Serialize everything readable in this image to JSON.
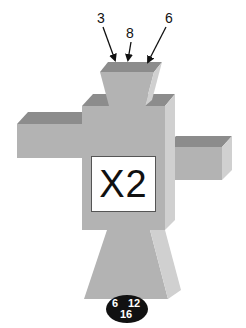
{
  "diagram": {
    "type": "block-figure",
    "center_label": "X2",
    "top_labels": [
      {
        "text": "3"
      },
      {
        "text": "8"
      },
      {
        "text": "6"
      }
    ],
    "badge": {
      "left": "6",
      "right": "12",
      "bottom": "16"
    },
    "colors": {
      "top_face": "#8c8c8c",
      "front_face": "#b3b3b3",
      "side_face": "#d0d0d0",
      "label_bg": "#ffffff",
      "badge_bg": "#111111",
      "text": "#111111"
    }
  }
}
